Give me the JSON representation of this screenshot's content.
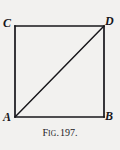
{
  "figure": {
    "caption_full": "Fig. 197.",
    "caption_prefix_lead": "F",
    "caption_prefix_small": "IG",
    "caption_prefix_dot": ".",
    "caption_number": "197.",
    "background_color": "#f2f1ef",
    "ink_color": "#17161a",
    "shape": "square-with-diagonal",
    "vertices": [
      {
        "name": "C",
        "label": "C",
        "position": "top-left",
        "x": 15,
        "y": 26
      },
      {
        "name": "D",
        "label": "D",
        "position": "top-right",
        "x": 104,
        "y": 26
      },
      {
        "name": "A",
        "label": "A",
        "position": "bottom-left",
        "x": 15,
        "y": 117
      },
      {
        "name": "B",
        "label": "B",
        "position": "bottom-right",
        "x": 104,
        "y": 117
      }
    ],
    "edges": [
      {
        "name": "top-edge",
        "from": "C",
        "to": "D"
      },
      {
        "name": "right-edge",
        "from": "D",
        "to": "B"
      },
      {
        "name": "bottom-edge",
        "from": "A",
        "to": "B"
      },
      {
        "name": "left-edge",
        "from": "C",
        "to": "A"
      },
      {
        "name": "diagonal-A-D",
        "from": "A",
        "to": "D"
      }
    ]
  }
}
